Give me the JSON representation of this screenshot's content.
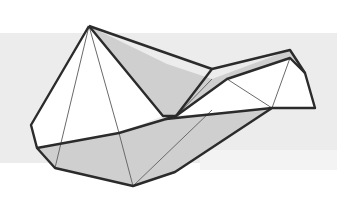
{
  "figure": {
    "type": "polyhedral-line-drawing",
    "width": 337,
    "height": 204,
    "colors": {
      "background": "#ffffff",
      "band": "#ececec",
      "face_shaded": "#cfcfcf",
      "face_white": "#ffffff",
      "edge_bold": "#2b2b2b",
      "edge_thin": "#6a6a6a"
    },
    "band": {
      "x": 0,
      "y": 33,
      "width": 337,
      "height": 130
    },
    "vertices": {
      "apex": [
        89,
        26
      ],
      "left_top": [
        31,
        125
      ],
      "left_mid": [
        37,
        148
      ],
      "left_bottom": [
        55,
        168
      ],
      "bottom": [
        133,
        186
      ],
      "bottom_right": [
        175,
        172
      ],
      "center_left": [
        119,
        133
      ],
      "center": [
        176,
        116
      ],
      "center_dip": [
        163,
        116
      ],
      "ridge_right": [
        290,
        50
      ],
      "ridge_mid": [
        225,
        67
      ],
      "inner_right": [
        237,
        108
      ],
      "right_upper": [
        305,
        73
      ],
      "right_lower": [
        315,
        108
      ],
      "inner_ridge_left": [
        212,
        79
      ],
      "fan_bottom_right": [
        272,
        108
      ]
    }
  }
}
